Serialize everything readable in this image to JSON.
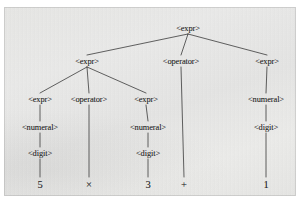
{
  "figure": {
    "kind": "parse-tree-diagram",
    "description": "Syntax parse tree for the arithmetic expression 5 x 3 + 1",
    "background_color": "#eaeae8",
    "ink_color": "#2e2e2e",
    "border_color": "#8c8c8c"
  },
  "chart_data": {
    "type": "diagram",
    "title": "",
    "layout": "top-down tree",
    "nodes": [
      {
        "id": "n0",
        "label": "<expr>",
        "level": 0,
        "x": 188,
        "y": 28
      },
      {
        "id": "n1",
        "label": "<expr>",
        "level": 1,
        "x": 87,
        "y": 61
      },
      {
        "id": "n2",
        "label": "<operator>",
        "level": 1,
        "x": 181,
        "y": 61
      },
      {
        "id": "n3",
        "label": "<expr>",
        "level": 1,
        "x": 267,
        "y": 61
      },
      {
        "id": "n4",
        "label": "<expr>",
        "level": 2,
        "x": 40,
        "y": 99
      },
      {
        "id": "n5",
        "label": "<operator>",
        "level": 2,
        "x": 89,
        "y": 99
      },
      {
        "id": "n6",
        "label": "<expr>",
        "level": 2,
        "x": 146,
        "y": 99
      },
      {
        "id": "n7",
        "label": "<numeral>",
        "level": 2,
        "x": 266,
        "y": 99
      },
      {
        "id": "n8",
        "label": "<numeral>",
        "level": 3,
        "x": 40,
        "y": 127
      },
      {
        "id": "n9",
        "label": "<numeral>",
        "level": 3,
        "x": 148,
        "y": 127
      },
      {
        "id": "n10",
        "label": "<digit>",
        "level": 3,
        "x": 266,
        "y": 127
      },
      {
        "id": "n11",
        "label": "<digit>",
        "level": 4,
        "x": 40,
        "y": 153
      },
      {
        "id": "n12",
        "label": "<digit>",
        "level": 4,
        "x": 148,
        "y": 153
      }
    ],
    "terminals": [
      {
        "id": "t0",
        "label": "5",
        "x": 40,
        "y": 184
      },
      {
        "id": "t1",
        "label": "×",
        "x": 89,
        "y": 184
      },
      {
        "id": "t2",
        "label": "3",
        "x": 148,
        "y": 184
      },
      {
        "id": "t3",
        "label": "+",
        "x": 184,
        "y": 184
      },
      {
        "id": "t4",
        "label": "1",
        "x": 266,
        "y": 184
      }
    ],
    "edges": [
      {
        "from": "n0",
        "to": "n1"
      },
      {
        "from": "n0",
        "to": "n2"
      },
      {
        "from": "n0",
        "to": "n3"
      },
      {
        "from": "n1",
        "to": "n4"
      },
      {
        "from": "n1",
        "to": "n5"
      },
      {
        "from": "n1",
        "to": "n6"
      },
      {
        "from": "n2",
        "to": "t3"
      },
      {
        "from": "n3",
        "to": "n7"
      },
      {
        "from": "n4",
        "to": "n8"
      },
      {
        "from": "n5",
        "to": "t1"
      },
      {
        "from": "n6",
        "to": "n9"
      },
      {
        "from": "n7",
        "to": "n10"
      },
      {
        "from": "n8",
        "to": "n11"
      },
      {
        "from": "n9",
        "to": "n12"
      },
      {
        "from": "n10",
        "to": "t4"
      },
      {
        "from": "n11",
        "to": "t0"
      },
      {
        "from": "n12",
        "to": "t2"
      }
    ],
    "expression": "5 × 3 + 1",
    "grammar_symbols": [
      "<expr>",
      "<operator>",
      "<numeral>",
      "<digit>"
    ]
  }
}
